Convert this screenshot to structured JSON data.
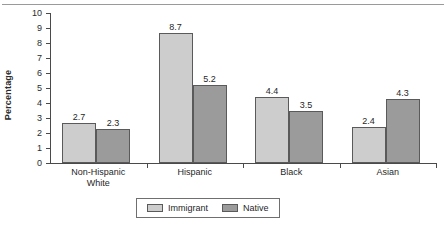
{
  "figure": {
    "title_remnant": "",
    "ylabel": "Percentage"
  },
  "chart_data": {
    "type": "bar",
    "title": "",
    "xlabel": "",
    "ylabel": "Percentage",
    "ylim": [
      0,
      10
    ],
    "yticks": [
      0,
      1,
      2,
      3,
      4,
      5,
      6,
      7,
      8,
      9,
      10
    ],
    "ytick_labels": [
      "0",
      "1",
      "2",
      "3",
      "4",
      "5",
      "6",
      "7",
      "8",
      "9",
      "10"
    ],
    "grid": false,
    "legend_position": "bottom-center",
    "categories": [
      "Non-Hispanic\nWhite",
      "Hispanic",
      "Black",
      "Asian"
    ],
    "series": [
      {
        "name": "Immigrant",
        "color": "#cdcdcd",
        "values": [
          2.7,
          8.7,
          4.4,
          2.4
        ],
        "labels": [
          "2.7",
          "8.7",
          "4.4",
          "2.4"
        ]
      },
      {
        "name": "Native",
        "color": "#9b9b9b",
        "values": [
          2.3,
          5.2,
          3.5,
          4.3
        ],
        "labels": [
          "2.3",
          "5.2",
          "3.5",
          "4.3"
        ]
      }
    ]
  },
  "legend": {
    "items": [
      {
        "label": "Immigrant",
        "color": "#cdcdcd"
      },
      {
        "label": "Native",
        "color": "#9b9b9b"
      }
    ]
  }
}
